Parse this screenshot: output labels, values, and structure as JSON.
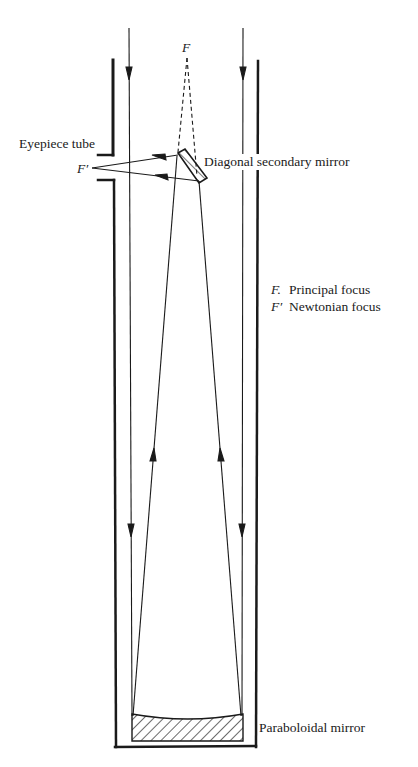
{
  "diagram": {
    "type": "Newtonian reflecting telescope cross-section",
    "labels": {
      "principal_focus_symbol": "F",
      "newtonian_focus_symbol": "F′",
      "eyepiece_tube": "Eyepiece tube",
      "secondary_mirror": "Diagonal secondary mirror",
      "primary_mirror": "Paraboloidal mirror"
    },
    "legend": [
      {
        "symbol": "F.",
        "description": "Principal focus"
      },
      {
        "symbol": "F′",
        "description": "Newtonian focus"
      }
    ],
    "colors": {
      "line": "#1a1a1a",
      "background": "#ffffff"
    }
  }
}
